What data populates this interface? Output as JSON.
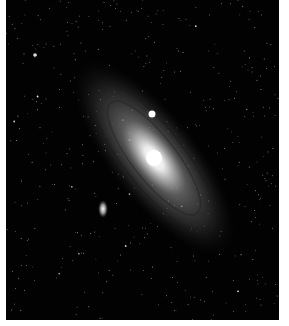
{
  "image": {
    "subject": "Andromeda Galaxy (spiral galaxy with satellite galaxies and star field)",
    "alt": "Andromeda Galaxy",
    "colors": {
      "background": "#020202",
      "core": "#ffffff",
      "disk": "#9a9a9a",
      "frame": "#ffffff"
    }
  }
}
